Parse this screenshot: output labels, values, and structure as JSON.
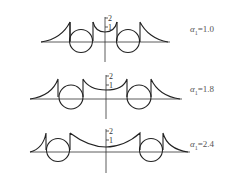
{
  "panels": [
    {
      "id": "alpha-1.0",
      "label_symbol": "α",
      "label_sub": "1",
      "label_value": "=1.0",
      "ticks": [
        "2",
        "1"
      ]
    },
    {
      "id": "alpha-1.8",
      "label_symbol": "α",
      "label_sub": "1",
      "label_value": "=1.8",
      "ticks": [
        "2",
        "1"
      ]
    },
    {
      "id": "alpha-2.4",
      "label_symbol": "α",
      "label_sub": "1",
      "label_value": "=2.4",
      "ticks": [
        "2",
        "1"
      ]
    }
  ]
}
